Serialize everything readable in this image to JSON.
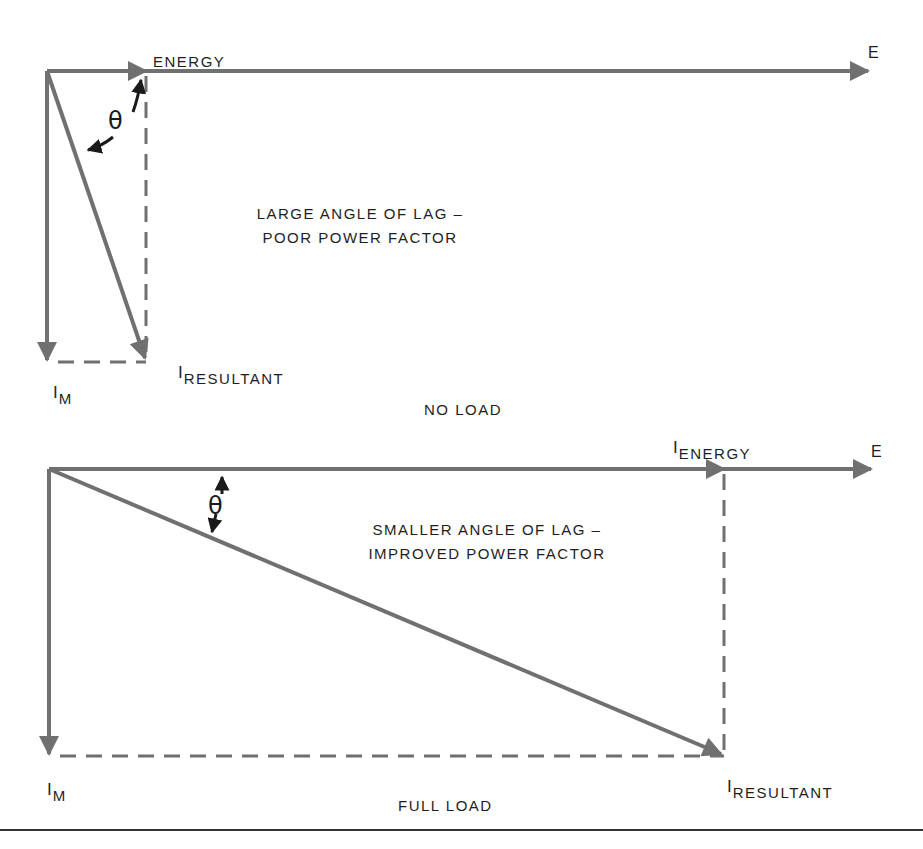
{
  "colors": {
    "vector": "#707070",
    "ink": "#1e1e1e",
    "dash": "#707070",
    "rule": "#333333"
  },
  "top_diagram": {
    "title": "NO LOAD",
    "caption_line1": "LARGE ANGLE OF LAG –",
    "caption_line2": "POOR POWER FACTOR",
    "energy_label": "ENERGY",
    "e_label": "E",
    "theta_label": "θ",
    "im_prefix": "I",
    "im_sub": "M",
    "resultant_prefix": "I",
    "resultant_sub": "RESULTANT",
    "geometry": {
      "origin": [
        47,
        71
      ],
      "e_end": [
        868,
        71
      ],
      "i_energy": [
        146,
        71
      ],
      "i_m": [
        47,
        362
      ],
      "i_resultant": [
        146,
        362
      ]
    }
  },
  "bottom_diagram": {
    "title": "FULL LOAD",
    "caption_line1": "SMALLER ANGLE OF LAG –",
    "caption_line2": "IMPROVED POWER FACTOR",
    "energy_prefix": "I",
    "energy_sub": "ENERGY",
    "e_label": "E",
    "theta_label": "θ",
    "im_prefix": "I",
    "im_sub": "M",
    "resultant_prefix": "I",
    "resultant_sub": "RESULTANT",
    "geometry": {
      "origin": [
        49,
        469
      ],
      "e_end": [
        871,
        469
      ],
      "i_energy": [
        724,
        469
      ],
      "i_m": [
        49,
        756
      ],
      "i_resultant": [
        724,
        756
      ]
    }
  }
}
